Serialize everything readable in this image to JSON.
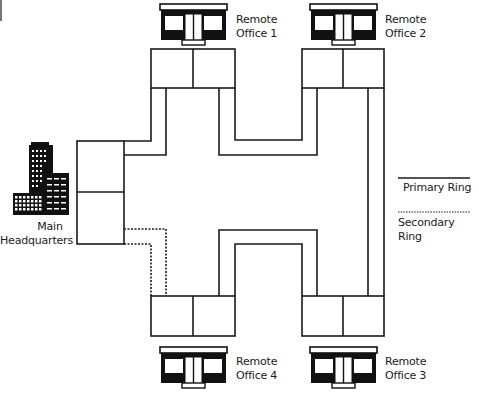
{
  "diagram": {
    "type": "network-topology",
    "nodes": {
      "hq": {
        "label_line1": "Main",
        "label_line2": "Headquarters",
        "icon": "office-building-icon"
      },
      "office1": {
        "label_line1": "Remote",
        "label_line2": "Office 1",
        "icon": "storefront-icon"
      },
      "office2": {
        "label_line1": "Remote",
        "label_line2": "Office 2",
        "icon": "storefront-icon"
      },
      "office3": {
        "label_line1": "Remote",
        "label_line2": "Office 3",
        "icon": "storefront-icon"
      },
      "office4": {
        "label_line1": "Remote",
        "label_line2": "Office 4",
        "icon": "storefront-icon"
      }
    },
    "legend": {
      "primary": {
        "label": "Primary Ring",
        "style": "solid"
      },
      "secondary": {
        "label": "Secondary Ring",
        "style": "dotted"
      }
    },
    "colors": {
      "line": "#1a1a1a",
      "background": "#ffffff"
    }
  }
}
